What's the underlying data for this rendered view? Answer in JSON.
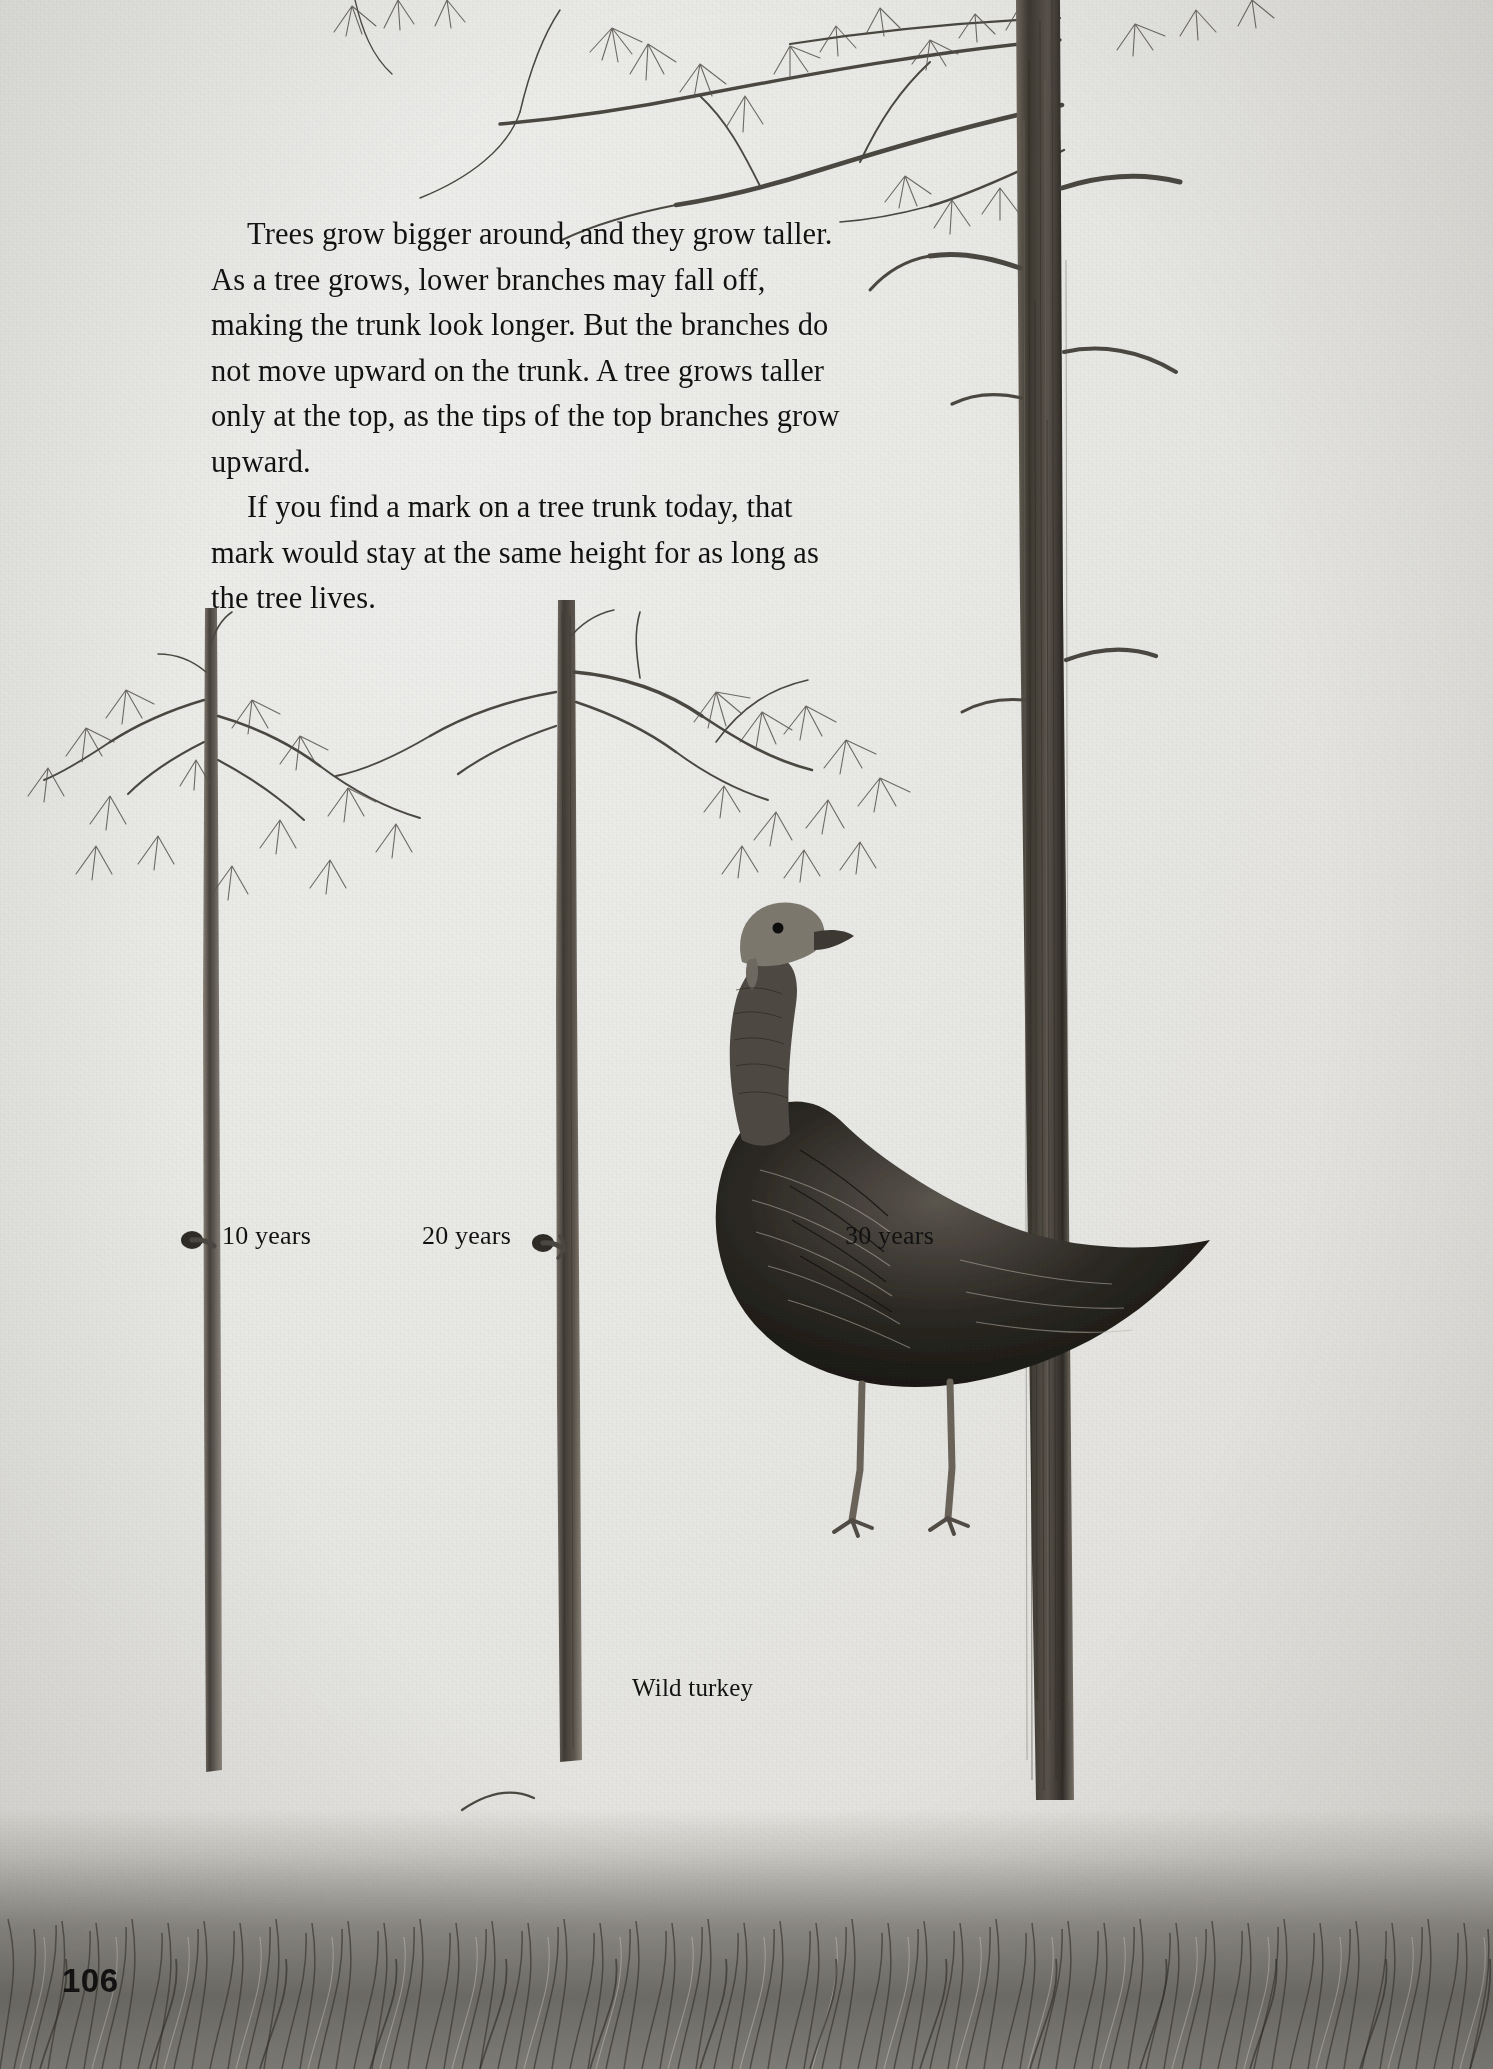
{
  "page": {
    "number": "106",
    "background_color": "#e7e7e4",
    "ink_color": "#111111"
  },
  "body_text": {
    "paragraph_1": "Trees grow bigger around, and they grow taller.  As a tree grows, lower branches may fall off, making the trunk look longer.  But the branches do not move upward on the trunk.  A tree grows taller only at the top, as the tips of the top branches grow upward.",
    "paragraph_2": "If you find a mark on a tree trunk today, that mark would stay at the same height for as long as the tree lives."
  },
  "illustration": {
    "description": "Pencil drawing of three pine trees of increasing age with a mark at the same height on each trunk, a wild turkey standing at right, grass along the bottom",
    "labels": [
      {
        "id": "tree-10",
        "text": "10 years"
      },
      {
        "id": "tree-20",
        "text": "20 years"
      },
      {
        "id": "tree-30",
        "text": "30 years"
      },
      {
        "id": "turkey",
        "text": "Wild turkey"
      }
    ],
    "mark_height_note": "All three trunk marks are drawn at the same height above the ground"
  }
}
